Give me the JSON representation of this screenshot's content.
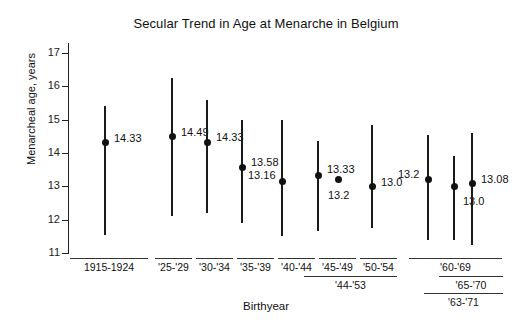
{
  "chart_data": {
    "type": "scatter",
    "title": "Secular Trend in Age at Menarche in Belgium",
    "xlabel": "Birthyear",
    "ylabel": "Menarcheal age, years",
    "ylim": [
      11,
      17
    ],
    "yticks": [
      "11",
      "12",
      "13",
      "14",
      "15",
      "16",
      "17"
    ],
    "grid": false,
    "legend": "none",
    "points": [
      {
        "label": "1915-1924",
        "value": 14.33,
        "value_label": "14.33",
        "low": 11.55,
        "high": 15.4,
        "has_errorbar": true
      },
      {
        "label": "'25-'29",
        "value": 14.49,
        "value_label": "14.49",
        "low": 12.1,
        "high": 16.25,
        "has_errorbar": true
      },
      {
        "label": "'30-'34",
        "value": 14.33,
        "value_label": "14.33",
        "low": 12.2,
        "high": 15.6,
        "has_errorbar": true
      },
      {
        "label": "'35-'39",
        "value": 13.58,
        "value_label": "13.58",
        "low": 11.9,
        "high": 15.0,
        "has_errorbar": true
      },
      {
        "label": "'40-'44",
        "value": 13.16,
        "value_label": "13.16",
        "low": 11.5,
        "high": 15.0,
        "has_errorbar": true
      },
      {
        "label": "'45-'49",
        "value": 13.33,
        "value_label": "13.33",
        "low": 11.65,
        "high": 14.35,
        "has_errorbar": true
      },
      {
        "label": "'44-'53",
        "value": 13.2,
        "value_label": "13.2",
        "low": null,
        "high": null,
        "has_errorbar": false
      },
      {
        "label": "'50-'54",
        "value": 13.0,
        "value_label": "13.0",
        "low": 11.75,
        "high": 14.85,
        "has_errorbar": true
      },
      {
        "label": "'60-'69",
        "value": 13.2,
        "value_label": "13.2",
        "low": 11.4,
        "high": 14.55,
        "has_errorbar": true
      },
      {
        "label": "'65-'70",
        "value": 13.0,
        "value_label": "13.0",
        "low": 11.4,
        "high": 13.9,
        "has_errorbar": true
      },
      {
        "label": "'63-'71",
        "value": 13.08,
        "value_label": "13.08",
        "low": 11.25,
        "high": 14.6,
        "has_errorbar": true
      }
    ],
    "x_groups": [
      {
        "label": "1915-1924",
        "tier": 1
      },
      {
        "label": "'25-'29",
        "tier": 1
      },
      {
        "label": "'30-'34",
        "tier": 1
      },
      {
        "label": "'35-'39",
        "tier": 1
      },
      {
        "label": "'40-'44",
        "tier": 1
      },
      {
        "label": "'45-'49",
        "tier": 1
      },
      {
        "label": "'50-'54",
        "tier": 1
      },
      {
        "label": "'44-'53",
        "tier": 2
      },
      {
        "label": "'60-'69",
        "tier": 1
      },
      {
        "label": "'65-'70",
        "tier": 2
      },
      {
        "label": "'63-'71",
        "tier": 3
      }
    ],
    "colors": {
      "marker": "#111111",
      "errorbar": "#1b1b1b",
      "axis": "#222222",
      "background": "#ffffff"
    }
  }
}
